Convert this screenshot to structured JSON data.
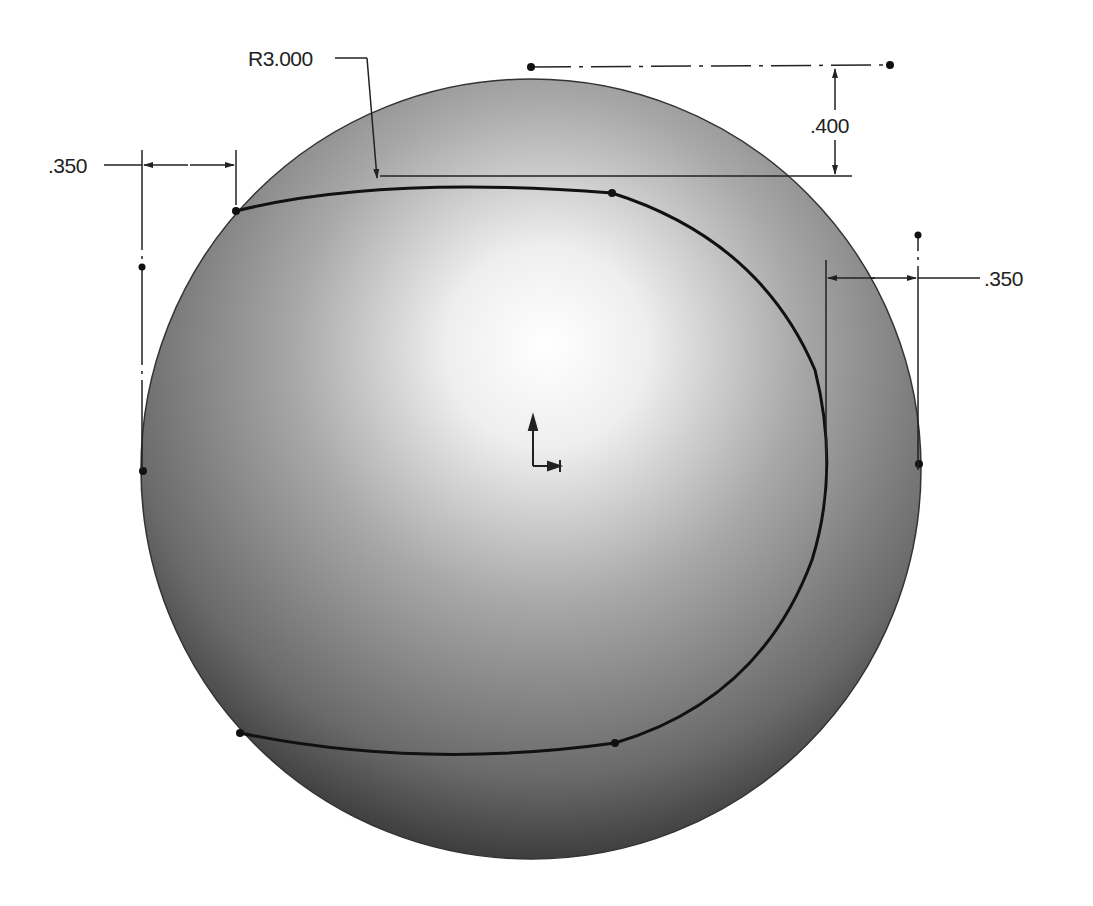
{
  "drawing": {
    "type": "CAD sketch on spherical surface",
    "background": "#ffffff",
    "sphere": {
      "cx": 531,
      "cy": 469,
      "r": 390,
      "highlight_color": "#ffffff",
      "shadow_color": "#1a1a1a"
    },
    "origin_icon": "coordinate-origin-icon"
  },
  "dimensions": {
    "radius": {
      "label": "R3.000"
    },
    "top_offset": {
      "label": ".400"
    },
    "left_offset": {
      "label": ".350"
    },
    "right_offset": {
      "label": ".350"
    }
  },
  "colors": {
    "line": "#111111",
    "dimension": "#222222"
  }
}
